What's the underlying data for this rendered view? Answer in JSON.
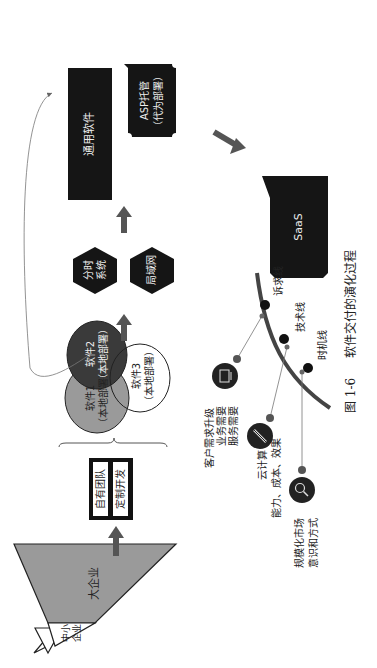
{
  "pyramid": {
    "top_label_line1": "中小",
    "top_label_line2": "企业",
    "bottom_label": "大企业"
  },
  "team_box": {
    "row1": "自有团队",
    "row2": "定制开发"
  },
  "venn": {
    "circle1_line1": "软件1",
    "circle1_line2": "（本地部署）",
    "circle2_line1": "软件2",
    "circle2_line2": "（本地部署）",
    "circle3_line1": "软件3",
    "circle3_line2": "（本地部署）"
  },
  "hexagons": {
    "timesharing": "分时\n系统",
    "timesharing_line1": "分时",
    "timesharing_line2": "系统",
    "lan": "局域网"
  },
  "general_software": "通用软件",
  "asp": {
    "line1": "ASP托管",
    "line2": "（代为部署）"
  },
  "saas": "SaaS",
  "timeline": {
    "lines": [
      {
        "label": "诉求线"
      },
      {
        "label": "技术线"
      },
      {
        "label": "时机线"
      }
    ],
    "factors": [
      {
        "icon": "monitor-icon",
        "line1": "客户需求升级",
        "line2": "业务需要",
        "line3": "服务需要"
      },
      {
        "icon": "pencil-icon",
        "line1": "云计算",
        "line2": "能力、成本、效果"
      },
      {
        "icon": "search-icon",
        "line1": "规模化市场",
        "line2": "意识和方式"
      }
    ]
  },
  "caption": {
    "figure_no": "图 1-6",
    "title": "软件交付的演化过程"
  },
  "colors": {
    "black_box": "#151515",
    "gray_fill": "#9a9a9a",
    "dark_circle": "#3a3a3a",
    "arrow": "#555555",
    "arc": "#444444"
  }
}
